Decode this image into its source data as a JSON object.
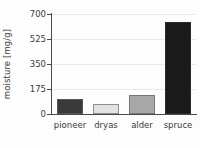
{
  "chart_data": {
    "type": "bar",
    "title": "",
    "xlabel": "",
    "ylabel": "moisture [mg/g]",
    "categories": [
      "pioneer",
      "dryas",
      "alder",
      "spruce"
    ],
    "values": [
      105,
      70,
      130,
      645
    ],
    "ylim": [
      0,
      700
    ],
    "yticks": [
      0,
      175,
      350,
      525,
      700
    ],
    "ytick_labels": [
      "0",
      "175",
      "350",
      "525",
      "700"
    ],
    "grid": "horizontal",
    "legend": "none",
    "bar_colors": [
      "#3a3a3a",
      "#e2e2e2",
      "#a8a8a8",
      "#1a1a1a"
    ],
    "bar_edge_colors": [
      "#555555",
      "#8f8f8f",
      "#777777",
      "#2a2a2a"
    ],
    "series": [
      {
        "name": "moisture",
        "values": [
          105,
          70,
          130,
          645
        ]
      }
    ]
  },
  "axes": {
    "y_title": "moisture [mg/g]",
    "tick_0": "0",
    "tick_1": "175",
    "tick_2": "350",
    "tick_3": "525",
    "tick_4": "700",
    "cat_0": "pioneer",
    "cat_1": "dryas",
    "cat_2": "alder",
    "cat_3": "spruce"
  },
  "style": {
    "axis_color": "#4a4a4a",
    "grid_color": "#e8e8e8",
    "text_color": "#3b3b3b",
    "background": "#fdfdfd"
  }
}
